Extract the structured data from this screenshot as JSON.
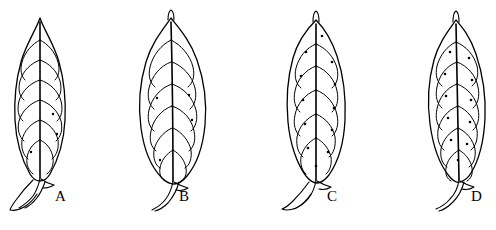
{
  "figure": {
    "type": "line-drawing-diagram",
    "background_color": "#ffffff",
    "ink_color": "#000000",
    "width": 496,
    "height": 230,
    "panel_count": 4
  },
  "panels": [
    {
      "label": "A",
      "name": "leaf-a",
      "label_x": 61,
      "label_y": 198,
      "leaf": {
        "shape": "narrow-elliptic-lanceolate",
        "apex": "acute",
        "base": "attenuate",
        "petiole": "long-winged",
        "vein_pairs": 6,
        "glands_visible": true,
        "gland_count": 3,
        "center_x": 40,
        "tip_y": 18,
        "blade_bottom_y": 176,
        "max_half_width": 26
      }
    },
    {
      "label": "B",
      "name": "leaf-b",
      "label_x": 185,
      "label_y": 198,
      "leaf": {
        "shape": "broad-obovate-elliptic",
        "apex": "acuminate-mucronate",
        "base": "cuneate",
        "petiole": "short-stout",
        "vein_pairs": 7,
        "glands_visible": true,
        "gland_count": 4,
        "center_x": 168,
        "tip_y": 12,
        "blade_bottom_y": 180,
        "max_half_width": 33
      }
    },
    {
      "label": "C",
      "name": "leaf-c",
      "label_x": 333,
      "label_y": 198,
      "leaf": {
        "shape": "broad-oblong-elliptic",
        "apex": "rounded-mucronate",
        "base": "cuneate",
        "petiole": "medium-winged",
        "vein_pairs": 6,
        "glands_visible": true,
        "gland_count": 12,
        "center_x": 316,
        "tip_y": 14,
        "blade_bottom_y": 178,
        "max_half_width": 34
      }
    },
    {
      "label": "D",
      "name": "leaf-d",
      "label_x": 477,
      "label_y": 198,
      "leaf": {
        "shape": "obovate-elliptic",
        "apex": "acuminate",
        "base": "cuneate",
        "petiole": "short-curved",
        "vein_pairs": 7,
        "glands_visible": true,
        "gland_count": 11,
        "center_x": 456,
        "tip_y": 14,
        "blade_bottom_y": 178,
        "max_half_width": 31
      }
    }
  ]
}
